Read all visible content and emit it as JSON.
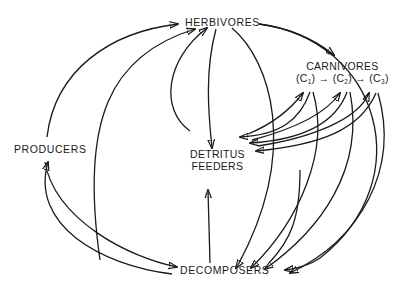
{
  "diagram": {
    "type": "food-web",
    "nodes": {
      "herbivores": {
        "label": "HERBIVORES"
      },
      "carnivores": {
        "label": "CARNIVORES",
        "chain": [
          "(C",
          "1",
          ") → (C",
          "2",
          ") → (C",
          "3",
          ")"
        ]
      },
      "producers": {
        "label": "PRODUCERS"
      },
      "detritus": {
        "line1": "DETRITUS",
        "line2": "FEEDERS"
      },
      "decomposers": {
        "label": "DECOMPOSERS"
      }
    },
    "edges": [
      {
        "from": "PRODUCERS",
        "to": "HERBIVORES"
      },
      {
        "from": "DECOMPOSERS",
        "to": "HERBIVORES"
      },
      {
        "from": "DETRITUS FEEDERS",
        "to": "HERBIVORES"
      },
      {
        "from": "HERBIVORES",
        "to": "DETRITUS FEEDERS"
      },
      {
        "from": "HERBIVORES",
        "to": "CARNIVORES"
      },
      {
        "from": "HERBIVORES",
        "to": "DECOMPOSERS"
      },
      {
        "from": "PRODUCERS",
        "to": "DECOMPOSERS"
      },
      {
        "from": "DECOMPOSERS",
        "to": "PRODUCERS"
      },
      {
        "from": "DECOMPOSERS",
        "to": "DETRITUS FEEDERS"
      },
      {
        "from": "DETRITUS FEEDERS",
        "to": "C1"
      },
      {
        "from": "C1",
        "to": "DETRITUS FEEDERS"
      },
      {
        "from": "DETRITUS FEEDERS",
        "to": "C2"
      },
      {
        "from": "C2",
        "to": "DETRITUS FEEDERS"
      },
      {
        "from": "DETRITUS FEEDERS",
        "to": "C3"
      },
      {
        "from": "C3",
        "to": "DETRITUS FEEDERS"
      },
      {
        "from": "C1",
        "to": "DECOMPOSERS"
      },
      {
        "from": "C2",
        "to": "DECOMPOSERS"
      },
      {
        "from": "C3",
        "to": "DECOMPOSERS"
      },
      {
        "from": "CARNIVORES",
        "to": "DECOMPOSERS"
      }
    ]
  }
}
